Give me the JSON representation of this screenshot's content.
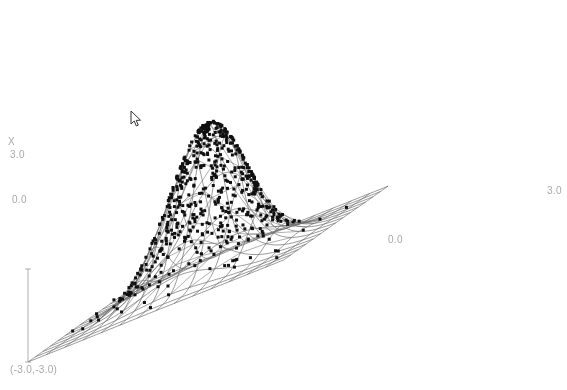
{
  "plot": {
    "type": "3d-surface-scatter",
    "background_color": "#ffffff",
    "mesh_color": "#707070",
    "point_color": "#101010",
    "label_color": "#a8a8a8",
    "axis_labels": {
      "vertical_axis_name": "X",
      "vertical_tick_top": "3.0",
      "vertical_tick_mid": "0.0",
      "horizontal_tick_mid": "0.0",
      "horizontal_tick_right": "3.0",
      "origin_corner": "(-3.0,-3.0)"
    },
    "cursor": {
      "name": "mouse-pointer",
      "x": 133,
      "y": 113
    }
  },
  "chart_data": {
    "type": "surface",
    "title": "",
    "xlabel": "X",
    "ylabel": "",
    "zlabel": "",
    "xlim": [
      -3.0,
      3.0
    ],
    "ylim": [
      -3.0,
      3.0
    ],
    "grid": true,
    "legend": "none",
    "surface": {
      "function": "bivariate gaussian",
      "peak_value": 1.0,
      "peak_center": [
        0.0,
        0.0
      ],
      "sigma": 0.85,
      "grid_divisions": 14,
      "x_ticks": [
        -3.0,
        0.0,
        3.0
      ],
      "y_ticks": [
        -3.0,
        0.0,
        3.0
      ]
    },
    "scatter": {
      "name": "sampled points",
      "count": 600,
      "mean": [
        0.0,
        0.0
      ],
      "std": [
        0.85,
        0.85
      ],
      "marker": "filled-square",
      "marker_size": 3
    },
    "outliers": [
      {
        "x": 1.4,
        "y": -2.1
      },
      {
        "x": 0.45,
        "y": -2.8
      }
    ]
  }
}
